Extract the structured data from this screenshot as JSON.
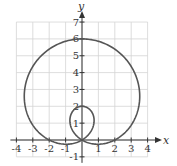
{
  "chart_data": {
    "type": "line",
    "title": "",
    "equation": "r = 2 + 4 sin(θ)",
    "xlabel": "x",
    "ylabel": "y",
    "xlim": [
      -4,
      4
    ],
    "ylim": [
      -1,
      7
    ],
    "grid": true,
    "x_ticks": [
      "-4",
      "-3",
      "-2",
      "-1",
      "1",
      "2",
      "3",
      "4"
    ],
    "y_ticks": [
      "-1",
      "1",
      "2",
      "3",
      "4",
      "5",
      "6",
      "7"
    ],
    "key_points": [
      {
        "x": 0,
        "y": 6,
        "note": "top of outer loop"
      },
      {
        "x": 0,
        "y": 2,
        "note": "top of inner loop"
      },
      {
        "x": 0,
        "y": 0,
        "note": "pole (inner loop meets)"
      },
      {
        "x": 2,
        "y": 0,
        "note": "x-intercept"
      },
      {
        "x": -2,
        "y": 0,
        "note": "x-intercept"
      }
    ],
    "series": [
      {
        "name": "r = 2 + 4 sin θ",
        "color": "#555555"
      }
    ]
  },
  "axes": {
    "x_label": "x",
    "y_label": "y"
  },
  "colors": {
    "curve": "#555555",
    "axis": "#333333",
    "grid": "#d4d4d4"
  }
}
